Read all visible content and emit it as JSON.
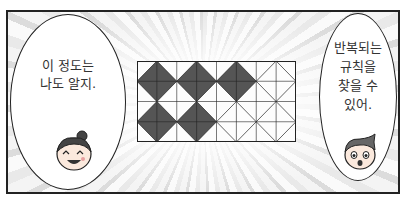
{
  "panel": {
    "border_color": "#222222",
    "background": "speed-lines"
  },
  "left_bubble": {
    "lines": [
      "이 정도는",
      "나도 알지."
    ],
    "character": "girl-face-laughing"
  },
  "right_bubble": {
    "lines": [
      "반복되는",
      "규칙을",
      "찾을 수",
      "있어."
    ],
    "character": "boy-face-surprised"
  },
  "pattern": {
    "columns": 8,
    "rows": 4,
    "diamond_fill": "#555555",
    "diamonds_top_row": [
      true,
      true,
      true,
      false
    ],
    "diamonds_bottom_row": [
      true,
      true,
      false,
      false
    ]
  }
}
